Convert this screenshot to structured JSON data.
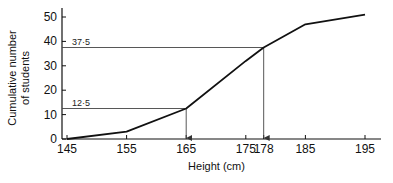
{
  "chart_data": {
    "type": "line",
    "title": "",
    "xlabel": "Height (cm)",
    "ylabel_lines": [
      "Cumulative number",
      "of students"
    ],
    "x_ticks": [
      145,
      155,
      165,
      175,
      178,
      185,
      195
    ],
    "x_tick_labels": [
      "145",
      "155",
      "165",
      "175",
      "178",
      "185",
      "195"
    ],
    "y_ticks": [
      0,
      10,
      20,
      30,
      40,
      50
    ],
    "y_tick_labels": [
      "0",
      "10",
      "20",
      "30",
      "40",
      "50"
    ],
    "xlim": [
      145,
      197
    ],
    "ylim": [
      0,
      54
    ],
    "grid": false,
    "series": [
      {
        "name": "cumulative frequency",
        "x": [
          145,
          155,
          165,
          175,
          178,
          185,
          195
        ],
        "y": [
          0,
          3,
          12.5,
          32,
          37.5,
          47,
          51
        ]
      }
    ],
    "annotations": [
      {
        "y": 12.5,
        "x": 165,
        "label": "12·5"
      },
      {
        "y": 37.5,
        "x": 178,
        "label": "37·5"
      }
    ]
  }
}
